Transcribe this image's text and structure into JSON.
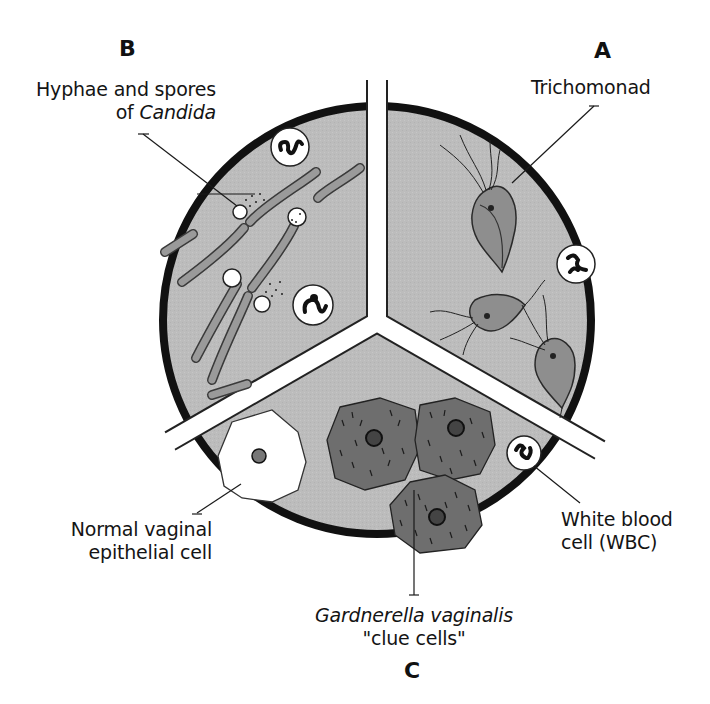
{
  "figure": {
    "type": "pie-divided microscopy diagram",
    "circle": {
      "cx": 377,
      "cy": 320,
      "r": 218
    },
    "colors": {
      "background": "#ffffff",
      "field_gray": "#bdbdbd",
      "rim": "#111111",
      "divider": "#ffffff",
      "trichomonad_body": "#8c8c8c",
      "clue_cell": "#6e6e6e",
      "hypha": "#9a9a9a",
      "wbc_fill": "#ffffff"
    }
  },
  "sections": [
    {
      "id": "A",
      "letter": "A",
      "label": "Trichomonad",
      "contents": [
        "trichomonads (3)",
        "white blood cell"
      ]
    },
    {
      "id": "B",
      "letter": "B",
      "label_line1": "Hyphae and spores",
      "label_line2_prefix": "of ",
      "label_line2_italic": "Candida",
      "contents": [
        "hyphae",
        "spores",
        "white blood cells (2)"
      ]
    },
    {
      "id": "C",
      "letter": "C",
      "label_italic": "Gardnerella vaginalis",
      "label_line2": "\"clue cells\"",
      "contents": [
        "clue cells (3)",
        "normal epithelial cell",
        "white blood cell"
      ]
    }
  ],
  "callouts": {
    "epithelial_line1": "Normal vaginal",
    "epithelial_line2": "epithelial cell",
    "wbc_line1": "White blood",
    "wbc_line2": "cell (WBC)"
  }
}
